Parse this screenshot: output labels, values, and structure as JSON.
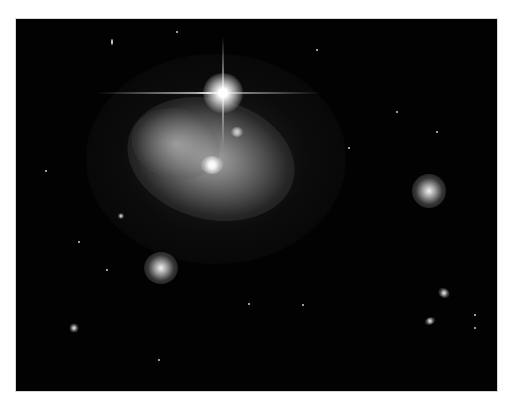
{
  "image": {
    "subject": "deep-field astronomical photograph with interacting galaxies and a bright foreground star",
    "frame": {
      "border_color": "#ffffff",
      "background_color": "#020202"
    },
    "objects": [
      {
        "name": "bright-star",
        "x": 207,
        "y": 74
      },
      {
        "name": "interacting-galaxy-core",
        "x": 196,
        "y": 146
      },
      {
        "name": "secondary-nucleus",
        "x": 221,
        "y": 113
      },
      {
        "name": "spiral-galaxy",
        "x": 413,
        "y": 172
      },
      {
        "name": "elliptical-galaxy",
        "x": 145,
        "y": 249
      },
      {
        "name": "small-galaxy-1",
        "x": 428,
        "y": 274
      },
      {
        "name": "small-galaxy-2",
        "x": 414,
        "y": 302
      },
      {
        "name": "small-galaxy-3",
        "x": 58,
        "y": 309
      }
    ]
  }
}
